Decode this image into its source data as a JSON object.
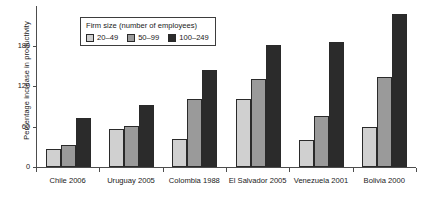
{
  "chart_data": {
    "type": "bar",
    "title": "",
    "xlabel": "",
    "ylabel": "Percentage increase in productivity",
    "ylim": [
      0,
      240
    ],
    "yticks": [
      0,
      60,
      120,
      180
    ],
    "grid": false,
    "legend_position": "top-left",
    "legend_title": "Firm size (number of employees)",
    "categories": [
      "Chile 2006",
      "Uruguay 2005",
      "Colombia 1988",
      "El Salvador 2005",
      "Venezuela 2001",
      "Bolivia 2000"
    ],
    "series": [
      {
        "name": "20–49",
        "values": [
          27,
          57,
          41,
          101,
          40,
          59
        ]
      },
      {
        "name": "50–99",
        "values": [
          33,
          61,
          101,
          130,
          75,
          134
        ]
      },
      {
        "name": "100–249",
        "values": [
          73,
          92,
          143,
          181,
          185,
          226
        ]
      }
    ],
    "colors": [
      "#d0d0d0",
      "#9a9a9a",
      "#2b2b2b"
    ]
  }
}
